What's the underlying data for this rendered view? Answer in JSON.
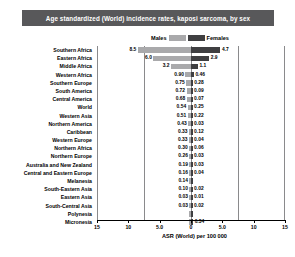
{
  "title": "Age standardized (World) incidence rates, kaposi sarcoma, by sex",
  "legend": {
    "male_label": "Males",
    "female_label": "Females",
    "male_color": "#a9a9ab",
    "female_color": "#3f3f41"
  },
  "axis": {
    "x_title": "ASR (World) per 100 000",
    "ticks": [
      "15",
      "10",
      "5.0",
      "0",
      "5.0",
      "10",
      "15"
    ],
    "tick_values": [
      -15,
      -10,
      -5,
      0,
      5,
      10,
      15
    ]
  },
  "chart_data": {
    "type": "bar",
    "title": "Age standardized (World) incidence rates, kaposi sarcoma, by sex",
    "xlabel": "ASR (World) per 100 000",
    "ylabel": "",
    "xlim": [
      -15,
      15
    ],
    "grid": true,
    "legend_position": "top",
    "orientation": "horizontal-diverging",
    "categories": [
      "Southern Africa",
      "Eastern Africa",
      "Middle Africa",
      "Western Africa",
      "Southern Europe",
      "South America",
      "Central America",
      "World",
      "Western Asia",
      "Northern America",
      "Caribbean",
      "Western Europe",
      "Northern Africa",
      "Northern Europe",
      "Australia and New Zealand",
      "Central and Eastern Europe",
      "Melanesia",
      "South-Eastern Asia",
      "Eastern Asia",
      "South-Central Asia",
      "Polynesia",
      "Micronesia"
    ],
    "series": [
      {
        "name": "Males",
        "color": "#a9a9ab",
        "values": [
          8.5,
          6.0,
          3.2,
          0.9,
          0.75,
          0.72,
          0.68,
          0.54,
          0.51,
          0.43,
          0.33,
          0.33,
          0.3,
          0.26,
          0.19,
          0.16,
          0.14,
          0.1,
          0.03,
          0.03,
          0.0,
          0.0
        ]
      },
      {
        "name": "Females",
        "color": "#3f3f41",
        "values": [
          4.7,
          2.9,
          1.1,
          0.46,
          0.28,
          0.09,
          0.07,
          0.25,
          0.22,
          0.03,
          0.12,
          0.04,
          0.06,
          0.03,
          0.03,
          0.04,
          0.0,
          0.02,
          0.01,
          0.02,
          0.0,
          0.34
        ]
      }
    ]
  },
  "rows": [
    {
      "cat": "Southern Africa",
      "m": "8.5",
      "f": "4.7"
    },
    {
      "cat": "Eastern Africa",
      "m": "6.0",
      "f": "2.9"
    },
    {
      "cat": "Middle Africa",
      "m": "3.2",
      "f": "1.1"
    },
    {
      "cat": "Western Africa",
      "m": "0.90",
      "f": "0.46"
    },
    {
      "cat": "Southern Europe",
      "m": "0.75",
      "f": "0.28"
    },
    {
      "cat": "South America",
      "m": "0.72",
      "f": "0.09"
    },
    {
      "cat": "Central America",
      "m": "0.68",
      "f": "0.07"
    },
    {
      "cat": "World",
      "m": "0.54",
      "f": "0.25"
    },
    {
      "cat": "Western Asia",
      "m": "0.51",
      "f": "0.22"
    },
    {
      "cat": "Northern America",
      "m": "0.43",
      "f": "0.03"
    },
    {
      "cat": "Caribbean",
      "m": "0.33",
      "f": "0.12"
    },
    {
      "cat": "Western Europe",
      "m": "0.33",
      "f": "0.04"
    },
    {
      "cat": "Northern Africa",
      "m": "0.30",
      "f": "0.06"
    },
    {
      "cat": "Northern Europe",
      "m": "0.26",
      "f": "0.03"
    },
    {
      "cat": "Australia and New Zealand",
      "m": "0.19",
      "f": "0.03"
    },
    {
      "cat": "Central and Eastern Europe",
      "m": "0.16",
      "f": "0.04"
    },
    {
      "cat": "Melanesia",
      "m": "0.14",
      "f": ""
    },
    {
      "cat": "South-Eastern Asia",
      "m": "0.10",
      "f": "0.02"
    },
    {
      "cat": "Eastern Asia",
      "m": "0.03",
      "f": "0.01"
    },
    {
      "cat": "South-Central Asia",
      "m": "0.03",
      "f": "0.02"
    },
    {
      "cat": "Polynesia",
      "m": "",
      "f": ""
    },
    {
      "cat": "Micronesia",
      "m": "",
      "f": "0.34"
    }
  ]
}
